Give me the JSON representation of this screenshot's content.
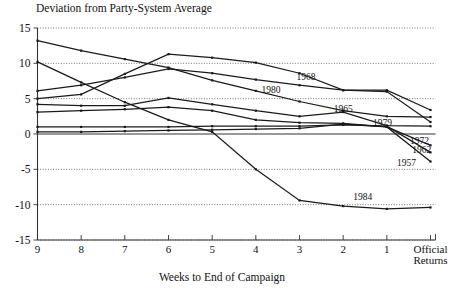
{
  "chart_data": {
    "type": "line",
    "title": "Deviation from Party-System Average",
    "xlabel": "Weeks to End of Campaign",
    "ylabel": "",
    "categories": [
      "9",
      "8",
      "7",
      "6",
      "5",
      "4",
      "3",
      "2",
      "1",
      "Official Returns"
    ],
    "x_tick_labels": [
      "9",
      "8",
      "7",
      "6",
      "5",
      "4",
      "3",
      "2",
      "1",
      "Official\nReturns"
    ],
    "y_tick_labels": [
      "15",
      "10",
      "5",
      "0",
      "-5",
      "-10",
      "-15"
    ],
    "y_ticks": [
      15,
      10,
      5,
      0,
      -5,
      -10,
      -15
    ],
    "ylim": [
      -15,
      15
    ],
    "xlim": [
      9,
      0
    ],
    "grid": "horizontal-dotted",
    "legend": "inline-series-labels",
    "series": [
      {
        "name": "1968",
        "label": "1968",
        "label_x_week": 2.85,
        "label_y_value": 8.1,
        "values": [
          5.0,
          5.6,
          8.5,
          11.3,
          10.8,
          10.1,
          8.6,
          6.2,
          6.2,
          3.4
        ]
      },
      {
        "name": "1980",
        "label": "1980",
        "label_x_week": 3.65,
        "label_y_value": 6.2,
        "values": [
          6.1,
          6.9,
          8.0,
          9.2,
          8.6,
          7.7,
          6.9,
          6.2,
          6.0,
          1.7
        ]
      },
      {
        "name": "1965",
        "label": "1965",
        "label_x_week": 2.0,
        "label_y_value": 3.6,
        "values": [
          13.2,
          11.8,
          10.6,
          9.4,
          7.6,
          6.1,
          4.6,
          3.3,
          2.5,
          2.4
        ]
      },
      {
        "name": "1979",
        "label": "1979",
        "label_x_week": 1.1,
        "label_y_value": 1.6,
        "values": [
          4.2,
          4.0,
          4.0,
          5.1,
          4.2,
          3.3,
          2.5,
          3.1,
          1.2,
          1.1
        ]
      },
      {
        "name": "1972",
        "label": "1972",
        "label_x_week": 0.25,
        "label_y_value": -0.9,
        "values": [
          3.1,
          3.3,
          3.5,
          3.8,
          3.3,
          2.0,
          1.6,
          1.5,
          1.0,
          -1.6
        ]
      },
      {
        "name": "1962",
        "label": "1962",
        "label_x_week": 0.2,
        "label_y_value": -2.3,
        "values": [
          1.0,
          1.0,
          1.0,
          1.0,
          1.1,
          1.1,
          1.1,
          1.3,
          1.1,
          -2.6
        ]
      },
      {
        "name": "1957",
        "label": "1957",
        "label_x_week": 0.55,
        "label_y_value": -4.1,
        "values": [
          0.3,
          0.3,
          0.4,
          0.5,
          0.6,
          0.7,
          0.8,
          1.4,
          1.0,
          -3.9
        ]
      },
      {
        "name": "1984",
        "label": "1984",
        "label_x_week": 1.55,
        "label_y_value": -8.9,
        "values": [
          10.2,
          7.3,
          4.5,
          2.0,
          0.3,
          -5.0,
          -9.4,
          -10.2,
          -10.6,
          -10.4
        ]
      }
    ]
  },
  "axes": {
    "title": "Deviation from Party-System Average",
    "x_axis_caption": "Weeks to End of Campaign",
    "official_returns_line1": "Official",
    "official_returns_line2": "Returns"
  }
}
